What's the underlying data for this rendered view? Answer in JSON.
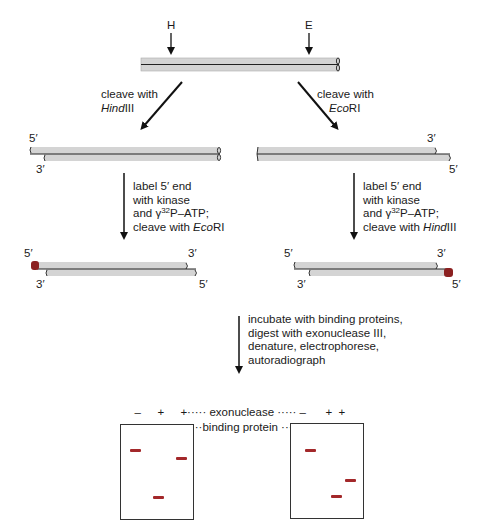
{
  "top_molecule": {
    "site_labels": [
      "H",
      "E"
    ]
  },
  "branch_left": {
    "cleave_text_1": "cleave with",
    "enzyme_italic": "Hind",
    "enzyme_roman": "III",
    "ends_fragment1": {
      "top_left": "5′",
      "bottom_left": "3′"
    },
    "label_step": {
      "line1": "label 5′ end",
      "line2": "with kinase",
      "line3_pre": "and ",
      "gamma": "γ",
      "sup": "32",
      "line3_post": "P–ATP;",
      "line4_pre": "cleave with ",
      "line4_italic": "Eco",
      "line4_roman": "RI"
    },
    "ends_fragment2": {
      "top_left": "5′",
      "top_right": "3′",
      "bottom_left": "3′",
      "bottom_right": "5′"
    }
  },
  "branch_right": {
    "cleave_text_1": "cleave with",
    "enzyme_italic": "Eco",
    "enzyme_roman": "RI",
    "ends_fragment1": {
      "top_right": "3′",
      "bottom_right": "5′"
    },
    "label_step": {
      "line1": "label 5′ end",
      "line2": "with kinase",
      "line3_pre": "and ",
      "gamma": "γ",
      "sup": "32",
      "line3_post": "P–ATP;",
      "line4_pre": "cleave with ",
      "line4_italic": "Hind",
      "line4_roman": "III"
    },
    "ends_fragment2": {
      "top_left": "5′",
      "top_right": "3′",
      "bottom_left": "3′",
      "bottom_right": "5′"
    }
  },
  "final_step": {
    "lines": [
      "incubate with binding proteins,",
      "digest with exonuclease III,",
      "denature, electrophorese,",
      "autoradiograph"
    ]
  },
  "lane_table": {
    "row1": {
      "label": "exonuclease",
      "left_gel": [
        "–",
        "+",
        "+"
      ],
      "right_gel": [
        "–",
        "+",
        "+"
      ]
    },
    "row2": {
      "label": "binding protein",
      "left_gel": [
        "+",
        "–",
        "+"
      ],
      "right_gel": [
        "+",
        "–",
        "+"
      ]
    },
    "dots_short": "·····",
    "dots_shorter": "····"
  },
  "gels": {
    "band_color": "#a3282a",
    "left": {
      "bands": [
        {
          "lane": 1,
          "y_pct": 0.27
        },
        {
          "lane": 3,
          "y_pct": 0.36
        },
        {
          "lane": 2,
          "y_pct": 0.78
        }
      ]
    },
    "right": {
      "bands": [
        {
          "lane": 1,
          "y_pct": 0.27
        },
        {
          "lane": 3,
          "y_pct": 0.6
        },
        {
          "lane": 2,
          "y_pct": 0.78
        }
      ]
    }
  },
  "colors": {
    "dna_fill": "#d4d4d4",
    "dna_line": "#222222",
    "label_cap": "#8b2020"
  }
}
